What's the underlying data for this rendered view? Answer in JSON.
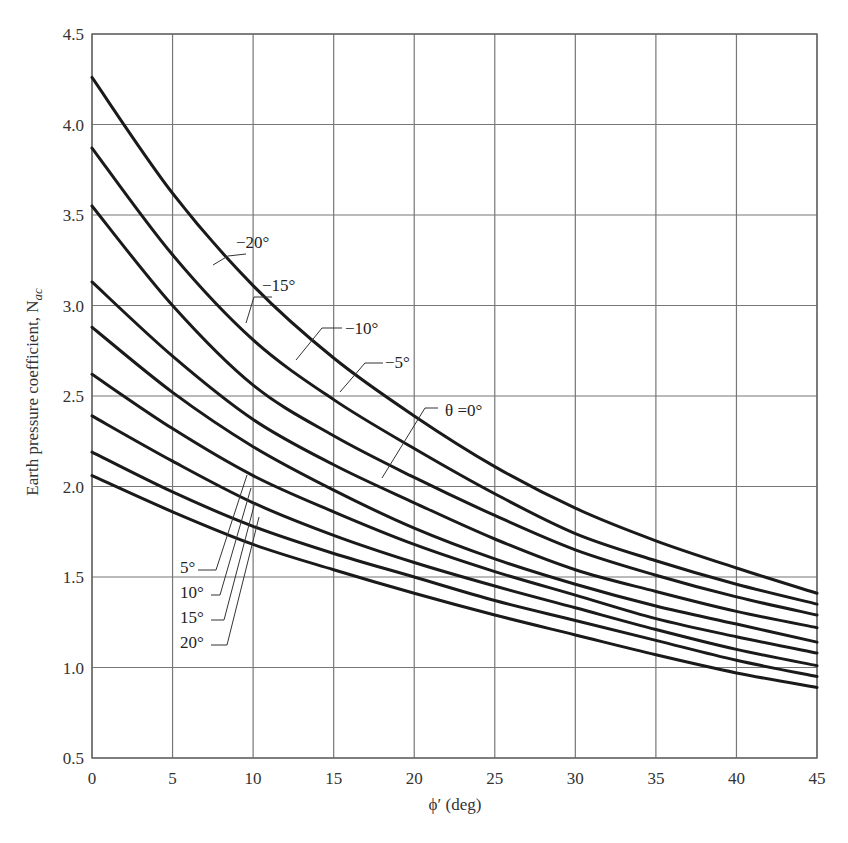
{
  "chart_data": {
    "type": "line",
    "title": "",
    "xlabel": "ϕ′ (deg)",
    "ylabel": "Earth pressure coefficient, N",
    "ylabel_subscript": "ac",
    "xlim": [
      0,
      45
    ],
    "ylim": [
      0.5,
      4.5
    ],
    "xticks": [
      0,
      5,
      10,
      15,
      20,
      25,
      30,
      35,
      40,
      45
    ],
    "yticks": [
      0.5,
      1.0,
      1.5,
      2.0,
      2.5,
      3.0,
      3.5,
      4.0,
      4.5
    ],
    "xtick_labels": [
      "0",
      "5",
      "10",
      "15",
      "20",
      "25",
      "30",
      "35",
      "40",
      "45"
    ],
    "ytick_labels": [
      "0.5",
      "1.0",
      "1.5",
      "2.0",
      "2.5",
      "3.0",
      "3.5",
      "4.0",
      "4.5"
    ],
    "grid": true,
    "legend": "inline labels with leader lines",
    "x": [
      0,
      5,
      10,
      15,
      20,
      25,
      30,
      35,
      40,
      45
    ],
    "series": [
      {
        "name": "θ = −20°",
        "label": "−20°",
        "values": [
          4.26,
          3.62,
          3.11,
          2.71,
          2.39,
          2.11,
          1.88,
          1.7,
          1.55,
          1.41
        ]
      },
      {
        "name": "θ = −15°",
        "label": "−15°",
        "values": [
          3.87,
          3.28,
          2.81,
          2.48,
          2.21,
          1.96,
          1.74,
          1.59,
          1.46,
          1.35
        ]
      },
      {
        "name": "θ = −10°",
        "label": "−10°",
        "values": [
          3.55,
          3.0,
          2.56,
          2.28,
          2.05,
          1.84,
          1.65,
          1.51,
          1.39,
          1.29
        ]
      },
      {
        "name": "θ = −5°",
        "label": "−5°",
        "values": [
          3.13,
          2.72,
          2.37,
          2.12,
          1.91,
          1.71,
          1.54,
          1.42,
          1.31,
          1.22
        ]
      },
      {
        "name": "θ = 0°",
        "label": "θ =0°",
        "values": [
          2.88,
          2.52,
          2.22,
          1.98,
          1.77,
          1.6,
          1.46,
          1.34,
          1.24,
          1.14
        ]
      },
      {
        "name": "θ = 5°",
        "label": "5°",
        "values": [
          2.62,
          2.32,
          2.06,
          1.86,
          1.68,
          1.53,
          1.4,
          1.27,
          1.17,
          1.08
        ]
      },
      {
        "name": "θ = 10°",
        "label": "10°",
        "values": [
          2.39,
          2.14,
          1.91,
          1.73,
          1.58,
          1.45,
          1.33,
          1.21,
          1.1,
          1.01
        ]
      },
      {
        "name": "θ = 15°",
        "label": "15°",
        "values": [
          2.19,
          1.97,
          1.78,
          1.63,
          1.5,
          1.37,
          1.26,
          1.15,
          1.04,
          0.95
        ]
      },
      {
        "name": "θ = 20°",
        "label": "20°",
        "values": [
          2.06,
          1.86,
          1.68,
          1.54,
          1.41,
          1.29,
          1.18,
          1.07,
          0.97,
          0.89
        ]
      }
    ],
    "annotations": [
      {
        "text": "−20°",
        "series": 0,
        "label_x": 236,
        "label_y": 248,
        "leader": [
          [
            246,
            254
          ],
          [
            228,
            256
          ],
          [
            213,
            265
          ]
        ]
      },
      {
        "text": "−15°",
        "series": 1,
        "label_x": 262,
        "label_y": 291,
        "leader": [
          [
            272,
            297
          ],
          [
            254,
            297
          ],
          [
            246,
            323
          ]
        ]
      },
      {
        "text": "−10°",
        "series": 2,
        "label_x": 345,
        "label_y": 334,
        "leader": [
          [
            342,
            328
          ],
          [
            322,
            328
          ],
          [
            296,
            360
          ]
        ]
      },
      {
        "text": "−5°",
        "series": 3,
        "label_x": 385,
        "label_y": 368,
        "leader": [
          [
            383,
            363
          ],
          [
            365,
            363
          ],
          [
            340,
            392
          ]
        ]
      },
      {
        "text": "θ =0°",
        "series": 4,
        "label_x": 445,
        "label_y": 416,
        "leader": [
          [
            438,
            408
          ],
          [
            425,
            408
          ],
          [
            382,
            478
          ]
        ]
      },
      {
        "text": "5°",
        "series": 5,
        "label_x": 180,
        "label_y": 573,
        "leader": [
          [
            198,
            570
          ],
          [
            216,
            570
          ],
          [
            247,
            475
          ]
        ]
      },
      {
        "text": "10°",
        "series": 6,
        "label_x": 180,
        "label_y": 598,
        "leader": [
          [
            211,
            595
          ],
          [
            220,
            595
          ],
          [
            251,
            488
          ]
        ]
      },
      {
        "text": "15°",
        "series": 7,
        "label_x": 180,
        "label_y": 623,
        "leader": [
          [
            211,
            620
          ],
          [
            224,
            620
          ],
          [
            255,
            502
          ]
        ]
      },
      {
        "text": "20°",
        "series": 8,
        "label_x": 180,
        "label_y": 648,
        "leader": [
          [
            211,
            645
          ],
          [
            227,
            645
          ],
          [
            259,
            517
          ]
        ]
      }
    ]
  }
}
